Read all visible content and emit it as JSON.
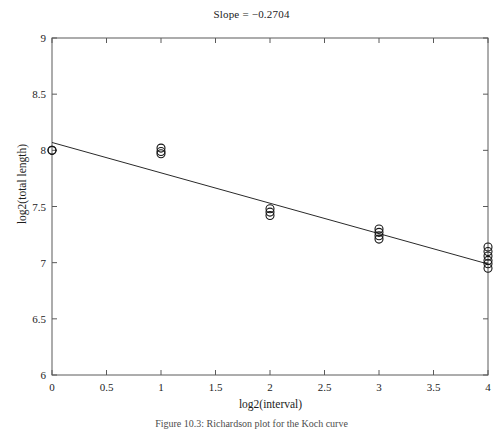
{
  "figure": {
    "title": "Slope = −0.2704",
    "caption": "Figure 10.3:  Richardson plot for the Koch curve"
  },
  "chart_data": {
    "type": "scatter",
    "title": "Slope = −0.2704",
    "xlabel": "log2(interval)",
    "ylabel": "log2(total length)",
    "xlim": [
      0,
      4
    ],
    "ylim": [
      6,
      9
    ],
    "xticks": [
      0,
      0.5,
      1,
      1.5,
      2,
      2.5,
      3,
      3.5,
      4
    ],
    "xtick_labels": [
      "0",
      "0.5",
      "1",
      "1.5",
      "2",
      "2.5",
      "3",
      "3.5",
      "4"
    ],
    "yticks": [
      6,
      6.5,
      7,
      7.5,
      8,
      8.5,
      9
    ],
    "ytick_labels": [
      "6",
      "6.5",
      "7",
      "7.5",
      "8",
      "8.5",
      "9"
    ],
    "grid": false,
    "legend": false,
    "marker": "open-circle",
    "marker_size": 5,
    "points": [
      {
        "x": 0,
        "y": 8.0
      },
      {
        "x": 0,
        "y": 8.0
      },
      {
        "x": 1,
        "y": 8.02
      },
      {
        "x": 1,
        "y": 7.99
      },
      {
        "x": 1,
        "y": 7.97
      },
      {
        "x": 2,
        "y": 7.48
      },
      {
        "x": 2,
        "y": 7.45
      },
      {
        "x": 2,
        "y": 7.42
      },
      {
        "x": 3,
        "y": 7.3
      },
      {
        "x": 3,
        "y": 7.27
      },
      {
        "x": 3,
        "y": 7.24
      },
      {
        "x": 3,
        "y": 7.21
      },
      {
        "x": 4,
        "y": 7.14
      },
      {
        "x": 4,
        "y": 7.1
      },
      {
        "x": 4,
        "y": 7.06
      },
      {
        "x": 4,
        "y": 7.02
      },
      {
        "x": 4,
        "y": 6.99
      },
      {
        "x": 4,
        "y": 6.95
      }
    ],
    "fit_line": {
      "slope": -0.2704,
      "intercept": 8.07,
      "x_start": 0,
      "x_end": 4,
      "y_start": 8.07,
      "y_end": 6.988
    },
    "slope_value": "−0.2704"
  },
  "colors": {
    "axis": "#5a5a5a",
    "marker_stroke": "#151515",
    "fit_line": "#2a2a2a",
    "text": "#1c1c1c",
    "background": "#ffffff"
  }
}
